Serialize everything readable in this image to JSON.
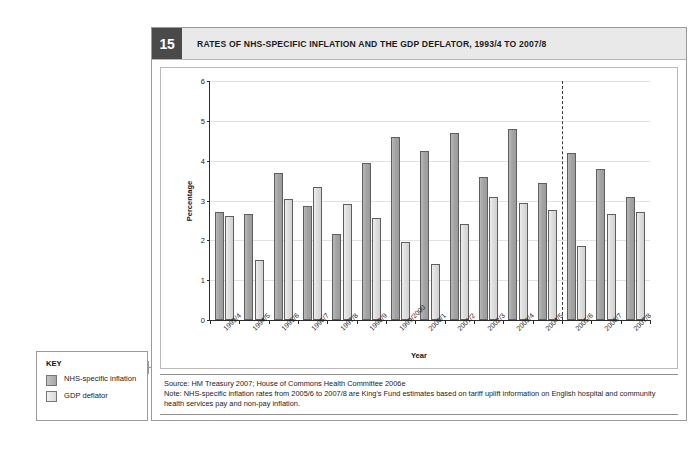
{
  "figure": {
    "number": "15",
    "title": "RATES OF NHS-SPECIFIC INFLATION AND THE GDP DEFLATOR, 1993/4 TO 2007/8"
  },
  "key": {
    "title": "KEY",
    "items": [
      {
        "label": "NHS-specific inflation",
        "color": "#a6a6a6"
      },
      {
        "label": "GDP deflator",
        "color": "#dcdcdc"
      }
    ]
  },
  "source": "Source: HM Treasury 2007; House of Commons Health Committee 2006e",
  "note": "Note: NHS-specific inflation rates from 2005/6 to 2007/8 are King's Fund estimates based on tariff uplift information on English hospital and community health services pay and non-pay inflation.",
  "chart_data": {
    "type": "bar",
    "title": "RATES OF NHS-SPECIFIC INFLATION AND THE GDP DEFLATOR, 1993/4 TO 2007/8",
    "xlabel": "Year",
    "ylabel": "Percentage",
    "ylim": [
      0,
      6
    ],
    "yticks": [
      0,
      1,
      2,
      3,
      4,
      5,
      6
    ],
    "grid": true,
    "legend_position": "external-left",
    "categories": [
      "1993/4",
      "1994/5",
      "1995/6",
      "1996/7",
      "1997/8",
      "1998/9",
      "1999/2000",
      "2000/1",
      "2001/2",
      "2002/3",
      "2003/4",
      "2004/5",
      "2005/6",
      "2006/7",
      "2007/8"
    ],
    "series": [
      {
        "name": "NHS-specific inflation",
        "color": "#a6a6a6",
        "values": [
          2.7,
          2.65,
          3.7,
          2.85,
          2.15,
          3.95,
          4.6,
          4.25,
          4.7,
          3.6,
          4.8,
          3.45,
          4.2,
          3.8,
          3.1
        ]
      },
      {
        "name": "GDP deflator",
        "color": "#dcdcdc",
        "values": [
          2.6,
          1.5,
          3.05,
          3.35,
          2.9,
          2.55,
          1.95,
          1.4,
          2.4,
          3.1,
          2.95,
          2.75,
          1.85,
          2.65,
          2.7
        ]
      }
    ],
    "annotations": [
      {
        "type": "vertical-dashed-line",
        "after_category": "2004/5",
        "label": "forecast divider"
      }
    ]
  }
}
